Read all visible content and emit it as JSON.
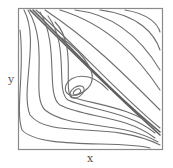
{
  "diagram": {
    "type": "phase-portrait",
    "axes": {
      "x_label": "x",
      "y_label": "y"
    },
    "features": [
      "stable spiral near center-left",
      "separatrix along diagonal from top-left to bottom-right",
      "homoclinic-like loop around spiral"
    ],
    "colors": {
      "line": "#6e6e6e",
      "frame": "#8a8a8a",
      "background": "#ffffff"
    }
  }
}
